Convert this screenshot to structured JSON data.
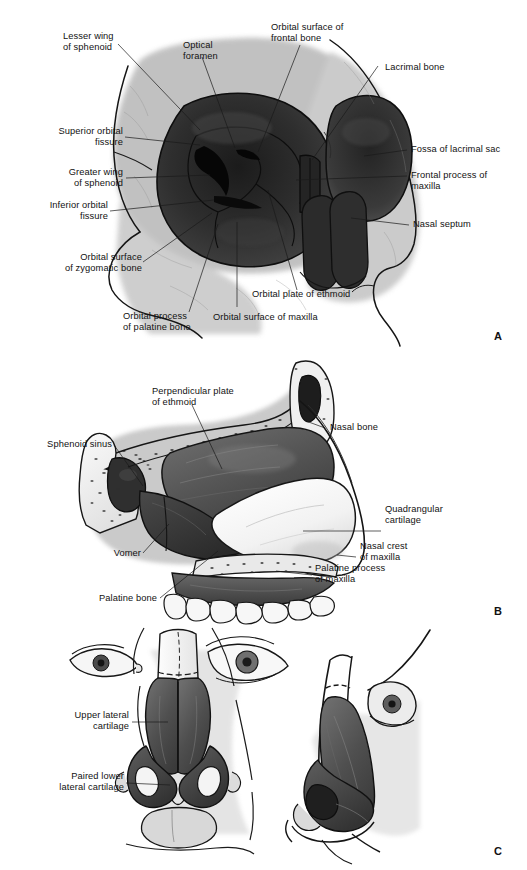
{
  "figure": {
    "background_color": "#ffffff",
    "ink_color": "#111111",
    "panel_count": 3
  },
  "panels": [
    {
      "letter": "A",
      "name": "orbit-anterior-view",
      "caption": "Anterior view of the bony orbit and piriform aperture",
      "labels": [
        {
          "id": "lesser-wing-of-sphenoid",
          "text": "Lesser wing\nof sphenoid"
        },
        {
          "id": "optical-foramen",
          "text": "Optical\nforamen"
        },
        {
          "id": "orbital-surface-frontal",
          "text": "Orbital surface of\nfrontal bone"
        },
        {
          "id": "lacrimal-bone",
          "text": "Lacrimal bone"
        },
        {
          "id": "superior-orbital-fissure",
          "text": "Superior orbital\nfissure"
        },
        {
          "id": "greater-wing-of-sphenoid",
          "text": "Greater wing\nof sphenoid"
        },
        {
          "id": "inferior-orbital-fissure",
          "text": "Inferior orbital\nfissure"
        },
        {
          "id": "orbital-surface-zygomatic",
          "text": "Orbital surface\nof zygomatic bone"
        },
        {
          "id": "orbital-process-palatine",
          "text": "Orbital process\nof palatine bone"
        },
        {
          "id": "orbital-surface-maxilla",
          "text": "Orbital surface of maxilla"
        },
        {
          "id": "orbital-plate-of-ethmoid",
          "text": "Orbital plate of ethmoid"
        },
        {
          "id": "fossa-of-lacrimal-sac",
          "text": "Fossa of lacrimal sac"
        },
        {
          "id": "frontal-process-of-maxilla",
          "text": "Frontal process of\nmaxilla"
        },
        {
          "id": "nasal-septum",
          "text": "Nasal septum"
        }
      ]
    },
    {
      "letter": "B",
      "name": "nasal-septum-sagittal-view",
      "caption": "Sagittal section through the nasal septum",
      "labels": [
        {
          "id": "perpendicular-plate-of-ethmoid",
          "text": "Perpendicular plate\nof ethmoid"
        },
        {
          "id": "sphenoid-sinus",
          "text": "Sphenoid sinus"
        },
        {
          "id": "nasal-bone",
          "text": "Nasal bone"
        },
        {
          "id": "quadrangular-cartilage",
          "text": "Quadrangular\ncartilage"
        },
        {
          "id": "nasal-crest-of-maxilla",
          "text": "Nasal crest\nof maxilla"
        },
        {
          "id": "palatine-process-of-maxilla",
          "text": "Palatine process\nof maxilla"
        },
        {
          "id": "vomer",
          "text": "Vomer"
        },
        {
          "id": "palatine-bone",
          "text": "Palatine bone"
        }
      ]
    },
    {
      "letter": "C",
      "name": "nasal-cartilages-views",
      "caption": "Basal and lateral views of the nasal cartilages",
      "labels": [
        {
          "id": "upper-lateral-cartilage",
          "text": "Upper lateral\ncartilage"
        },
        {
          "id": "paired-lower-lateral-cartilage",
          "text": "Paired lower\nlateral cartilage"
        }
      ]
    }
  ],
  "panel_letters": {
    "a": "A",
    "b": "B",
    "c": "C"
  }
}
